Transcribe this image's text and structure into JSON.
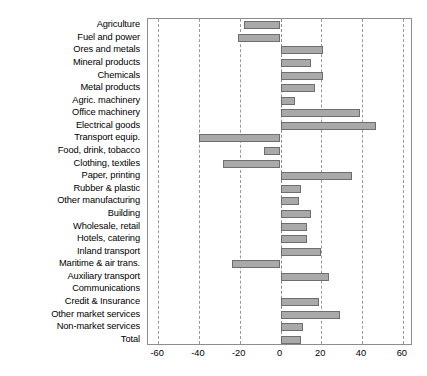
{
  "chart_data": {
    "type": "bar",
    "orientation": "horizontal",
    "title": "",
    "subtitle": "",
    "xlabel": "",
    "ylabel": "",
    "xlim": [
      -65,
      65
    ],
    "grid": true,
    "gridlines": "vertical dashed at each x tick",
    "legend": "none",
    "xticks": [
      -60,
      -40,
      -20,
      0,
      20,
      40,
      60
    ],
    "xtick_labels": [
      "-60",
      "-40",
      "-20",
      "0",
      "20",
      "40",
      "60"
    ],
    "bar_color": "#a9a9a9",
    "bar_edge_color": "#6e6e6e",
    "categories": [
      "Agriculture",
      "Fuel and power",
      "Ores and metals",
      "Mineral products",
      "Chemicals",
      "Metal products",
      "Agric. machinery",
      "Office machinery",
      "Electrical goods",
      "Transport equip.",
      "Food, drink, tobacco",
      "Clothing, textiles",
      "Paper, printing",
      "Rubber & plastic",
      "Other manufacturing",
      "Building",
      "Wholesale, retail",
      "Hotels, catering",
      "Inland transport",
      "Maritime & air trans.",
      "Auxiliary transport",
      "Communications",
      "Credit & Insurance",
      "Other market services",
      "Non-market services",
      "Total"
    ],
    "values": [
      -18,
      -21,
      21,
      15,
      21,
      17,
      7,
      39,
      47,
      -40,
      -8,
      -28,
      35,
      10,
      9,
      15,
      13,
      13,
      20,
      -24,
      24,
      0,
      19,
      29,
      11,
      10
    ]
  }
}
